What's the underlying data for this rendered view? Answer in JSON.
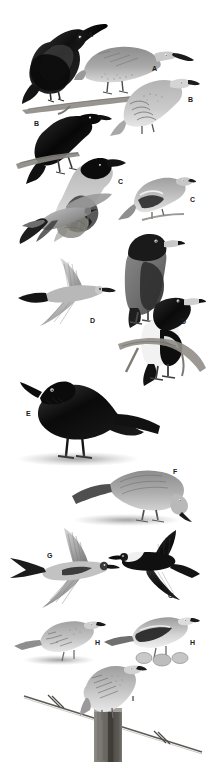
{
  "plate": {
    "title": "Bird identification plate",
    "background_color": "#ffffff",
    "width": 210,
    "height": 768,
    "style": "grayscale halftone field-guide illustration plate",
    "label_color": "#1a1a1a"
  },
  "labels": [
    {
      "id": "label-a-1",
      "text": "A",
      "x": 88,
      "y": 31
    },
    {
      "id": "label-a-2",
      "text": "A",
      "x": 152,
      "y": 65
    },
    {
      "id": "label-b-1",
      "text": "B",
      "x": 188,
      "y": 96
    },
    {
      "id": "label-b-2",
      "text": "B",
      "x": 34,
      "y": 120
    },
    {
      "id": "label-c-1",
      "text": "C",
      "x": 118,
      "y": 178
    },
    {
      "id": "label-c-2",
      "text": "C",
      "x": 190,
      "y": 196
    },
    {
      "id": "label-d-1",
      "text": "D",
      "x": 151,
      "y": 252
    },
    {
      "id": "label-d-2",
      "text": "D",
      "x": 90,
      "y": 317
    },
    {
      "id": "label-d-3",
      "text": "D",
      "x": 181,
      "y": 318
    },
    {
      "id": "label-e-1",
      "text": "E",
      "x": 26,
      "y": 410
    },
    {
      "id": "label-f-1",
      "text": "F",
      "x": 173,
      "y": 468
    },
    {
      "id": "label-g-1",
      "text": "G",
      "x": 47,
      "y": 552
    },
    {
      "id": "label-g-2",
      "text": "G",
      "x": 168,
      "y": 592
    },
    {
      "id": "label-h-1",
      "text": "H",
      "x": 95,
      "y": 639
    },
    {
      "id": "label-h-2",
      "text": "H",
      "x": 190,
      "y": 639
    },
    {
      "id": "label-i-1",
      "text": "I",
      "x": 132,
      "y": 695
    }
  ],
  "figures": [
    {
      "id": "fig-a-dark-perched",
      "label": "A",
      "description": "dark glossy bird perched on branch, long decurved bill, upper left",
      "x": 22,
      "y": 14,
      "w": 85,
      "h": 90
    },
    {
      "id": "fig-a-pale-perched",
      "label": "A",
      "description": "pale brown bird with long decurved bill perched on branch, upper right",
      "x": 78,
      "y": 36,
      "w": 115,
      "h": 62
    },
    {
      "id": "fig-b-pale-perched",
      "label": "B",
      "description": "pale scalloped bird perched, right side",
      "x": 112,
      "y": 70,
      "w": 85,
      "h": 62
    },
    {
      "id": "fig-b-black-perched",
      "label": "B",
      "description": "black and white pied bird perched on branch, left side",
      "x": 28,
      "y": 106,
      "w": 80,
      "h": 80
    },
    {
      "id": "fig-c-grey-hooded",
      "label": "C",
      "description": "grey bird with black hood perched on stump",
      "x": 52,
      "y": 152,
      "w": 80,
      "h": 85
    },
    {
      "id": "fig-c-small-barred",
      "label": "C",
      "description": "small barred-wing bird perched on twig, right",
      "x": 120,
      "y": 168,
      "w": 72,
      "h": 55
    },
    {
      "id": "fig-d-flight-upper",
      "label": "D",
      "description": "bird in flight seen from above, upper area",
      "x": 18,
      "y": 195,
      "w": 95,
      "h": 50
    },
    {
      "id": "fig-d-flight-lower",
      "label": "D",
      "description": "woodswallow in flight, broad triangular wings, white rump",
      "x": 20,
      "y": 258,
      "w": 95,
      "h": 70
    },
    {
      "id": "fig-d-grey-perched",
      "label": "D",
      "description": "grey butcherbird-like bird perched upright on branch",
      "x": 110,
      "y": 232,
      "w": 70,
      "h": 95
    },
    {
      "id": "fig-d-pied-perched",
      "label": "D",
      "description": "pied black and white bird perched on branch, lower right",
      "x": 135,
      "y": 290,
      "w": 72,
      "h": 95
    },
    {
      "id": "fig-e-crow",
      "label": "E",
      "description": "all black crow standing on ground",
      "x": 16,
      "y": 370,
      "w": 145,
      "h": 95
    },
    {
      "id": "fig-f-grey-forager",
      "label": "F",
      "description": "grey long tailed bird foraging head down on ground",
      "x": 72,
      "y": 462,
      "w": 120,
      "h": 62
    },
    {
      "id": "fig-g-swallow",
      "label": "G",
      "description": "swallow in flight with deeply forked tail, pale underparts",
      "x": 14,
      "y": 528,
      "w": 105,
      "h": 80
    },
    {
      "id": "fig-g-martin",
      "label": "G",
      "description": "dark martin in flight with white throat band",
      "x": 112,
      "y": 534,
      "w": 85,
      "h": 70
    },
    {
      "id": "fig-h-pipit-left",
      "label": "H",
      "description": "streaked pipit standing on ground, left",
      "x": 18,
      "y": 618,
      "w": 80,
      "h": 45
    },
    {
      "id": "fig-h-pipit-right",
      "label": "H",
      "description": "pied wagtail-like bird standing on rocks, right",
      "x": 108,
      "y": 614,
      "w": 88,
      "h": 52
    },
    {
      "id": "fig-i-bushlark",
      "label": "I",
      "description": "streaked bushlark perched on fence post with barbed wire",
      "x": 25,
      "y": 670,
      "w": 175,
      "h": 90
    }
  ],
  "scene_elements": [
    {
      "id": "branch-top",
      "description": "diagonal woody branch under the two A birds"
    },
    {
      "id": "branch-left",
      "description": "short branch under the black B bird"
    },
    {
      "id": "stump-c",
      "description": "short stump under the grey hooded C bird"
    },
    {
      "id": "branch-d",
      "description": "branch under the perched D birds"
    },
    {
      "id": "ground-shadow-e",
      "description": "speckled ground shadow under the E crow"
    },
    {
      "id": "ground-shadow-f",
      "description": "speckled ground shadow under the F bird"
    },
    {
      "id": "ground-shadow-h",
      "description": "speckled ground shadow under the left H pipit"
    },
    {
      "id": "rocks-h",
      "description": "small pale rocks under the right H bird"
    },
    {
      "id": "fence-post",
      "description": "weathered wooden fence post"
    },
    {
      "id": "barbed-wire",
      "description": "diagonal barbed wire strand with two barbs"
    }
  ]
}
